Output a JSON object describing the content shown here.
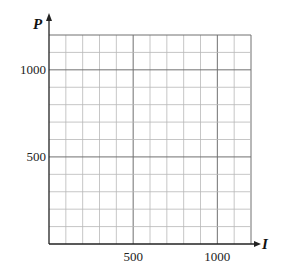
{
  "chart_data": {
    "type": "line",
    "title": "",
    "xlabel": "I",
    "ylabel": "P",
    "xlim": [
      0,
      1200
    ],
    "ylim": [
      0,
      1200
    ],
    "x_ticks": [
      500,
      1000
    ],
    "y_ticks": [
      500,
      1000
    ],
    "x_tick_labels": [
      "500",
      "1000"
    ],
    "y_tick_labels": [
      "500",
      "1000"
    ],
    "grid": true,
    "grid_step": 100,
    "major_grid_step": 500,
    "series": [],
    "legend": null
  },
  "colors": {
    "grid_minor": "#b8b8b8",
    "grid_major": "#707070",
    "axis": "#222222",
    "background": "#ffffff"
  }
}
